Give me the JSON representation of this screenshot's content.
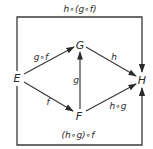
{
  "diagram": {
    "type": "commutative-diagram",
    "colors": {
      "stroke": "#3a3a3a",
      "text": "#2a2a2a",
      "background": "#ffffff"
    },
    "frame": {
      "top_label": "h∘(g∘f)",
      "bottom_label": "(h∘g)∘f"
    },
    "nodes": {
      "E": {
        "label": "E",
        "x": 17,
        "y": 78
      },
      "G": {
        "label": "G",
        "x": 80,
        "y": 45
      },
      "F": {
        "label": "F",
        "x": 79,
        "y": 115
      },
      "H": {
        "label": "H",
        "x": 142,
        "y": 80
      }
    },
    "edges": [
      {
        "from": "E",
        "to": "G",
        "label": "g∘f"
      },
      {
        "from": "E",
        "to": "F",
        "label": "f"
      },
      {
        "from": "F",
        "to": "G",
        "label": "g"
      },
      {
        "from": "G",
        "to": "H",
        "label": "h"
      },
      {
        "from": "F",
        "to": "H",
        "label": "h∘g"
      },
      {
        "from": "E",
        "to": "H",
        "label": "h∘(g∘f)",
        "route": "top"
      },
      {
        "from": "E",
        "to": "H",
        "label": "(h∘g)∘f",
        "route": "bottom"
      }
    ]
  }
}
